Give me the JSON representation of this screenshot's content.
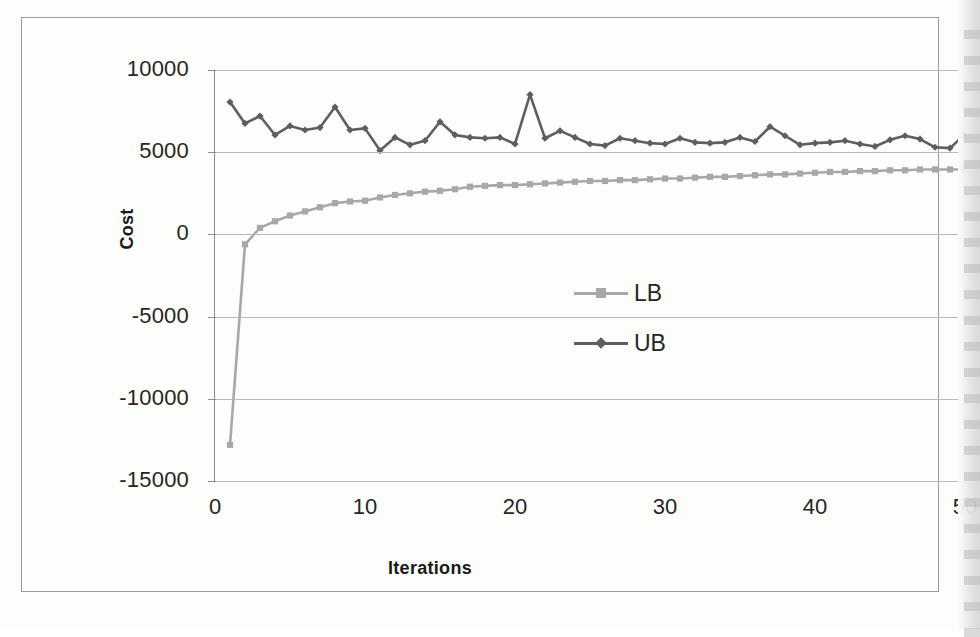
{
  "chart_data": {
    "type": "line",
    "title": "",
    "xlabel": "Iterations",
    "ylabel": "Cost",
    "xlim": [
      0,
      50
    ],
    "ylim": [
      -15000,
      10000
    ],
    "grid": true,
    "legend_position": "center",
    "x_ticks": [
      "0",
      "10",
      "20",
      "30",
      "40",
      "50"
    ],
    "x_tick_values": [
      0,
      10,
      20,
      30,
      40,
      50
    ],
    "y_ticks": [
      "-15000",
      "-10000",
      "-5000",
      "0",
      "5000",
      "10000"
    ],
    "y_tick_values": [
      -15000,
      -10000,
      -5000,
      0,
      5000,
      10000
    ],
    "x": [
      1,
      2,
      3,
      4,
      5,
      6,
      7,
      8,
      9,
      10,
      11,
      12,
      13,
      14,
      15,
      16,
      17,
      18,
      19,
      20,
      21,
      22,
      23,
      24,
      25,
      26,
      27,
      28,
      29,
      30,
      31,
      32,
      33,
      34,
      35,
      36,
      37,
      38,
      39,
      40,
      41,
      42,
      43,
      44,
      45,
      46,
      47,
      48,
      49,
      50
    ],
    "series": [
      {
        "name": "LB",
        "color": "#a8a8a8",
        "marker": "square",
        "values": [
          -12800,
          -600,
          400,
          800,
          1150,
          1400,
          1650,
          1900,
          2000,
          2050,
          2250,
          2400,
          2500,
          2600,
          2650,
          2750,
          2900,
          2950,
          3000,
          3000,
          3050,
          3100,
          3150,
          3200,
          3250,
          3250,
          3300,
          3300,
          3350,
          3400,
          3400,
          3450,
          3500,
          3500,
          3550,
          3600,
          3650,
          3650,
          3700,
          3750,
          3800,
          3800,
          3850,
          3850,
          3900,
          3900,
          3950,
          3950,
          3950,
          3950
        ]
      },
      {
        "name": "UB",
        "color": "#5e5e5e",
        "marker": "diamond",
        "values": [
          8050,
          6750,
          7200,
          6050,
          6600,
          6350,
          6500,
          7750,
          6350,
          6450,
          5100,
          5900,
          5450,
          5700,
          6850,
          6050,
          5900,
          5850,
          5900,
          5500,
          8500,
          5850,
          6300,
          5900,
          5500,
          5400,
          5850,
          5700,
          5550,
          5500,
          5850,
          5600,
          5550,
          5600,
          5900,
          5650,
          6550,
          6000,
          5450,
          5550,
          5600,
          5700,
          5500,
          5350,
          5750,
          6000,
          5800,
          5300,
          5250,
          6100
        ]
      }
    ]
  },
  "legend": {
    "items": [
      {
        "label": "LB"
      },
      {
        "label": "UB"
      }
    ]
  },
  "axes": {
    "y_title": "Cost",
    "x_title": "Iterations"
  },
  "colors": {
    "lb_series": "#a8a8a8",
    "ub_series": "#5e5e5e",
    "gridline": "#b9b9b9",
    "frame": "#9a9a9a",
    "text": "#262626"
  }
}
